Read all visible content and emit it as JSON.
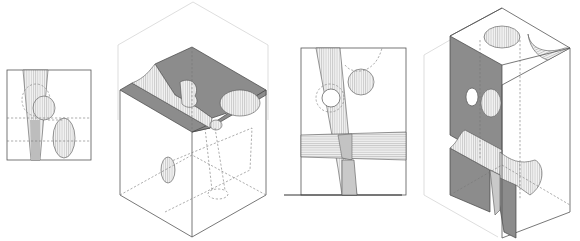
{
  "figure": {
    "colors": {
      "background": "#ffffff",
      "line": "#555555",
      "section_fill": "#8c8c8c",
      "hatch": "#999999"
    },
    "panels": [
      {
        "id": "plan-small",
        "type": "plan view",
        "label": ""
      },
      {
        "id": "axonometric-left",
        "type": "axonometric cutaway",
        "label": ""
      },
      {
        "id": "elevation",
        "type": "elevation with ground line",
        "label": ""
      },
      {
        "id": "axonometric-right",
        "type": "axonometric cutaway",
        "label": ""
      }
    ]
  }
}
